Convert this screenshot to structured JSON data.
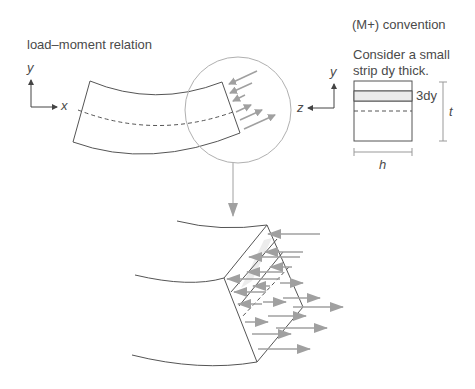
{
  "title": "load–moment relation",
  "convention": {
    "symbol": "(M+)",
    "label": "convention"
  },
  "strip_note": {
    "line1": "Consider a small",
    "line2": "strip dy thick."
  },
  "axes_left": {
    "vertical": "y",
    "horizontal": "x"
  },
  "axes_right": {
    "vertical": "y",
    "horizontal": "z"
  },
  "cross_section": {
    "strip_label": "3dy",
    "height_label": "t",
    "width_label": "h"
  },
  "colors": {
    "line": "#555555",
    "arrow": "#a0a0a0",
    "highlight": "#ebebeb",
    "circle": "#b0b0b0"
  }
}
